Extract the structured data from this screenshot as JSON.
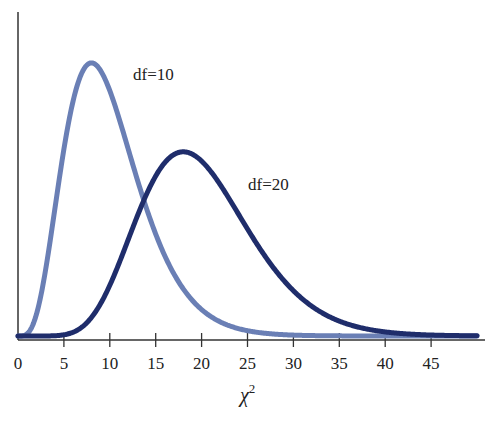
{
  "chart_data": {
    "type": "line",
    "title": "",
    "xlabel": "χ",
    "xlabel_superscript": "2",
    "ylabel": "",
    "xlim": [
      0,
      50
    ],
    "xticks": [
      0,
      5,
      10,
      15,
      20,
      25,
      30,
      35,
      40,
      45
    ],
    "xtick_labels": [
      "0",
      "5",
      "10",
      "15",
      "20",
      "25",
      "30",
      "35",
      "40",
      "45"
    ],
    "yticks": [],
    "grid": false,
    "legend": "inline labels",
    "series": [
      {
        "name": "df=10",
        "label": "df=10",
        "color": "#6a7fb5",
        "x": [
          0,
          1,
          2,
          3,
          4,
          5,
          6,
          7,
          8,
          9,
          10,
          11,
          12,
          13,
          14,
          15,
          16,
          17,
          18,
          19,
          20,
          22,
          24,
          26,
          28,
          30,
          32,
          35,
          40,
          45,
          50
        ],
        "values": [
          0,
          0.0008,
          0.0153,
          0.0471,
          0.0812,
          0.0902,
          0.1008,
          0.1041,
          0.1048,
          0.1001,
          0.0877,
          0.0789,
          0.0688,
          0.0582,
          0.0479,
          0.0385,
          0.0301,
          0.0233,
          0.0176,
          0.0131,
          0.0095,
          0.0049,
          0.0024,
          0.0011,
          0.0005,
          0.0002,
          0.0001,
          3e-05,
          0,
          0,
          0
        ]
      },
      {
        "name": "df=20",
        "label": "df=20",
        "color": "#1f2d6b",
        "x": [
          0,
          2,
          4,
          6,
          8,
          10,
          12,
          14,
          16,
          18,
          20,
          22,
          24,
          26,
          28,
          30,
          32,
          34,
          36,
          38,
          40,
          42,
          44,
          46,
          48,
          50
        ],
        "values": [
          0,
          0,
          0.0002,
          0.0025,
          0.0111,
          0.0292,
          0.0492,
          0.0634,
          0.068,
          0.0679,
          0.0626,
          0.0538,
          0.0439,
          0.0341,
          0.0253,
          0.018,
          0.0124,
          0.0082,
          0.0053,
          0.0033,
          0.002,
          0.0012,
          0.0007,
          0.0004,
          0.0002,
          0.0001
        ]
      }
    ],
    "annotations": [
      {
        "text": "df=10",
        "x": 12.8,
        "y_px": 80
      },
      {
        "text": "df=20",
        "x": 25,
        "y_px": 190
      }
    ]
  },
  "labels": {
    "df10": "df=10",
    "df20": "df=20",
    "xlabel_main": "χ",
    "xlabel_sup": "2"
  }
}
